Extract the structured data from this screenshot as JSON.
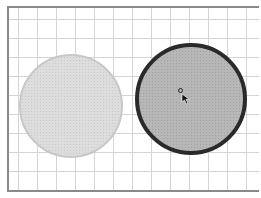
{
  "canvas": {
    "grid": {
      "spacing_px": 19,
      "color": "#d4d4d4"
    },
    "border_color": "#8a8a8a",
    "background": "#ffffff"
  },
  "shapes": [
    {
      "id": "left-circle",
      "type": "circle",
      "fill": "#dcdcdc",
      "stroke": "#c6c6c6",
      "state": "unselected"
    },
    {
      "id": "right-circle",
      "type": "circle",
      "fill": "#b7b7b7",
      "stroke": "#2a2a2a",
      "state": "selected"
    }
  ],
  "cursor": {
    "type": "move-arrow",
    "color": "#111111"
  }
}
